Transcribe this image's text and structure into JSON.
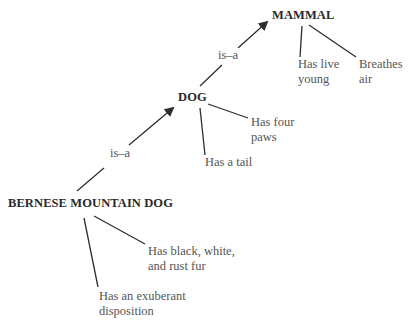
{
  "diagram": {
    "type": "semantic-network",
    "nodes": {
      "mammal": {
        "label": "MAMMAL"
      },
      "dog": {
        "label": "DOG"
      },
      "bernese": {
        "label": "BERNESE MOUNTAIN DOG"
      }
    },
    "relations": {
      "dog_to_mammal": {
        "label": "is–a"
      },
      "bernese_to_dog": {
        "label": "is–a"
      }
    },
    "attributes": {
      "mammal": [
        {
          "line1": "Has live",
          "line2": "young"
        },
        {
          "line1": "Breathes",
          "line2": "air"
        }
      ],
      "dog": [
        {
          "line1": "Has four",
          "line2": "paws"
        },
        {
          "line1": "Has a tail",
          "line2": ""
        }
      ],
      "bernese": [
        {
          "line1": "Has black, white,",
          "line2": "and rust fur"
        },
        {
          "line1": "Has an exuberant",
          "line2": "disposition"
        }
      ]
    },
    "colors": {
      "line": "#2e2e2e",
      "node_text": "#2a2a2a",
      "attr_text": "#555555",
      "background": "#ffffff"
    }
  }
}
